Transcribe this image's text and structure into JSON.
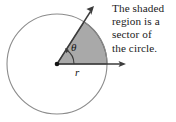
{
  "figure": {
    "type": "geometry-diagram",
    "width": 176,
    "height": 122,
    "background_color": "#ffffff"
  },
  "caption": {
    "lines": [
      "The shaded",
      "region is a",
      "sector of",
      "the circle."
    ],
    "text_color": "#1b1b1b"
  },
  "diagram": {
    "circle": {
      "center_x": 57,
      "center_y": 64,
      "radius": 50,
      "stroke_color": "#8c8c8c",
      "stroke_width": 1.1,
      "fill": "none"
    },
    "sector": {
      "start_angle_deg": 0,
      "end_angle_deg": 57,
      "fill_color": "#a9a9a9",
      "stroke_color": "#5a5a5a",
      "stroke_width": 1.1
    },
    "center_point": {
      "x": 57,
      "y": 64,
      "color": "#141414",
      "radius": 2.2
    },
    "rays": [
      {
        "name": "horizontal-ray",
        "from_x": 57,
        "from_y": 64,
        "to_x": 125,
        "to_y": 64,
        "color": "#3b3b3b",
        "arrowhead": true
      },
      {
        "name": "diagonal-ray",
        "from_x": 57,
        "from_y": 64,
        "to_x": 94,
        "to_y": 6,
        "color": "#3b3b3b",
        "arrowhead": true
      }
    ],
    "angle_arc": {
      "radius": 17,
      "start_angle_deg": 0,
      "end_angle_deg": 57,
      "color": "#3b3b3b",
      "arrowhead": true
    },
    "labels": {
      "theta": "θ",
      "radius": "r"
    }
  }
}
